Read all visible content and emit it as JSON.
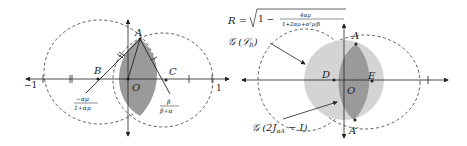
{
  "left_diagram": {
    "points": {
      "A": "A",
      "B": "B",
      "C": "C",
      "O": "O"
    },
    "ticks": {
      "minus_one": "−1",
      "one": "1"
    },
    "label_b_num": "−αμ",
    "label_b_den": "1+αμ",
    "label_c_num": "β",
    "label_c_den": "β+α"
  },
  "right_diagram": {
    "formula_lhs": "R =",
    "formula_sqrt_one": "1 −",
    "formula_num": "4αμ",
    "formula_den": "1+2αμ+α²μ/β",
    "label_lr": "𝒢 (ℒ",
    "label_lr_sub": "R",
    "label_lr_close": ")",
    "label_j": "𝒢 (2J",
    "label_j_sub": "αA",
    "label_j_close": " − I)",
    "points": {
      "A": "A",
      "A_prime": "A′",
      "D": "D",
      "E": "E",
      "O": "O"
    }
  },
  "colors": {
    "dark_gray": "#9a9a9a",
    "light_gray": "#d4d4d4",
    "stroke": "#222222"
  }
}
